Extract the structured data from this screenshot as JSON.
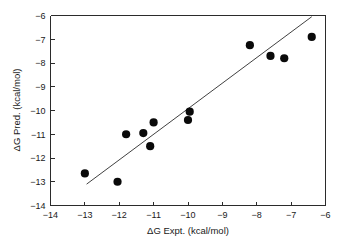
{
  "chart_data": {
    "type": "scatter",
    "title": "",
    "xlabel": "ΔG Expt. (kcal/mol)",
    "ylabel": "ΔG Pred. (kcal/mol)",
    "xlim": [
      -14,
      -6
    ],
    "ylim": [
      -14,
      -6
    ],
    "xticks": [
      -14,
      -13,
      -12,
      -11,
      -10,
      -9,
      -8,
      -7,
      -6
    ],
    "yticks": [
      -14,
      -13,
      -12,
      -11,
      -10,
      -9,
      -8,
      -7,
      -6
    ],
    "xticklabels": [
      "−14",
      "−13",
      "−12",
      "−11",
      "−10",
      "−9",
      "−8",
      "−7",
      "−6"
    ],
    "yticklabels": [
      "−14",
      "−13",
      "−12",
      "−11",
      "−10",
      "−9",
      "−8",
      "−7",
      "−6"
    ],
    "grid": false,
    "legend": false,
    "marker": "filled-circle",
    "marker_color": "#0a0a0a",
    "marker_size": 4.1,
    "line_color": "#2b2b2b",
    "axis_color": "#2b2b2b",
    "background": "#ffffff",
    "points": [
      {
        "x": -13.0,
        "y": -12.65
      },
      {
        "x": -12.05,
        "y": -13.0
      },
      {
        "x": -11.8,
        "y": -11.0
      },
      {
        "x": -11.3,
        "y": -10.95
      },
      {
        "x": -11.1,
        "y": -11.5
      },
      {
        "x": -11.0,
        "y": -10.5
      },
      {
        "x": -10.0,
        "y": -10.4
      },
      {
        "x": -9.95,
        "y": -10.05
      },
      {
        "x": -8.2,
        "y": -7.25
      },
      {
        "x": -7.6,
        "y": -7.7
      },
      {
        "x": -7.2,
        "y": -7.8
      },
      {
        "x": -6.4,
        "y": -6.9
      }
    ],
    "fit_line": {
      "x_start": -12.95,
      "y_start": -13.1,
      "x_end": -6.4,
      "y_end": -6.05
    }
  }
}
